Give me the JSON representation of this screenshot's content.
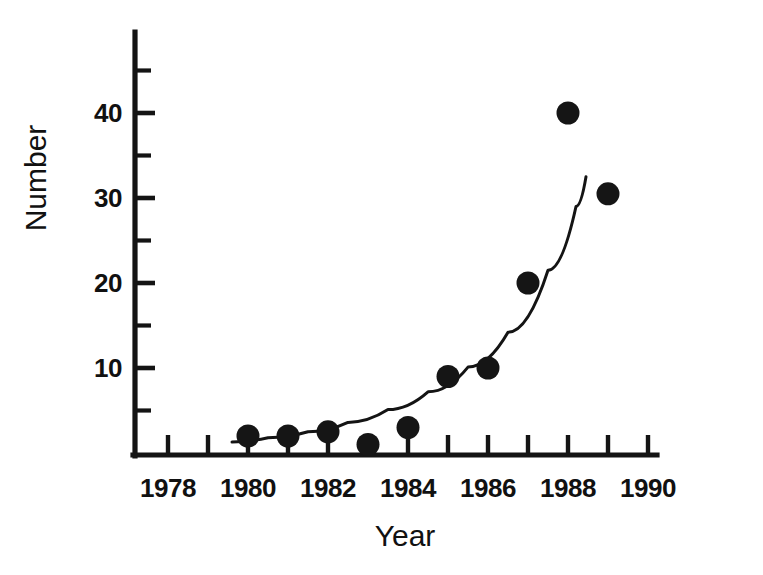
{
  "chart_data": {
    "type": "scatter",
    "title": "",
    "xlabel": "Year",
    "ylabel": "Number",
    "xlim": [
      1978,
      1990
    ],
    "ylim": [
      0,
      47.5
    ],
    "grid": false,
    "legend": null,
    "x": [
      1980,
      1981,
      1982,
      1983,
      1984,
      1985,
      1986,
      1987,
      1988,
      1989
    ],
    "values": [
      2,
      2,
      2.5,
      1,
      3,
      9,
      10,
      20,
      40,
      30.5
    ],
    "series": [
      {
        "name": "Observed number",
        "marker": "filled-circle",
        "color": "#151515",
        "points": [
          {
            "x": 1980,
            "y": 2
          },
          {
            "x": 1981,
            "y": 2
          },
          {
            "x": 1982,
            "y": 2.5
          },
          {
            "x": 1983,
            "y": 1
          },
          {
            "x": 1984,
            "y": 3
          },
          {
            "x": 1985,
            "y": 9
          },
          {
            "x": 1986,
            "y": 10
          },
          {
            "x": 1987,
            "y": 20
          },
          {
            "x": 1988,
            "y": 40
          },
          {
            "x": 1989,
            "y": 30.5
          }
        ]
      },
      {
        "name": "Fitted exponential curve",
        "marker": "none",
        "color": "#141414",
        "points": [
          {
            "x": 1979.6,
            "y": 1.3
          },
          {
            "x": 1980.5,
            "y": 1.8
          },
          {
            "x": 1981.5,
            "y": 2.5
          },
          {
            "x": 1982.5,
            "y": 3.6
          },
          {
            "x": 1983.5,
            "y": 5.1
          },
          {
            "x": 1984.5,
            "y": 7.2
          },
          {
            "x": 1985.5,
            "y": 10.1
          },
          {
            "x": 1986.5,
            "y": 14.2
          },
          {
            "x": 1987.5,
            "y": 21.5
          },
          {
            "x": 1988.2,
            "y": 29.0
          },
          {
            "x": 1988.45,
            "y": 32.5
          }
        ]
      }
    ],
    "x_ticks": [
      {
        "value": 1978,
        "label": "1978",
        "major": true
      },
      {
        "value": 1979,
        "label": "",
        "major": false
      },
      {
        "value": 1980,
        "label": "1980",
        "major": true
      },
      {
        "value": 1981,
        "label": "",
        "major": false
      },
      {
        "value": 1982,
        "label": "1982",
        "major": true
      },
      {
        "value": 1983,
        "label": "",
        "major": false
      },
      {
        "value": 1984,
        "label": "1984",
        "major": true
      },
      {
        "value": 1985,
        "label": "",
        "major": false
      },
      {
        "value": 1986,
        "label": "1986",
        "major": true
      },
      {
        "value": 1987,
        "label": "",
        "major": false
      },
      {
        "value": 1988,
        "label": "1988",
        "major": true
      },
      {
        "value": 1989,
        "label": "",
        "major": false
      },
      {
        "value": 1990,
        "label": "1990",
        "major": true
      }
    ],
    "y_ticks": [
      {
        "value": 5,
        "label": "",
        "major": false
      },
      {
        "value": 10,
        "label": "10",
        "major": true
      },
      {
        "value": 15,
        "label": "",
        "major": false
      },
      {
        "value": 20,
        "label": "20",
        "major": true
      },
      {
        "value": 25,
        "label": "",
        "major": false
      },
      {
        "value": 30,
        "label": "30",
        "major": true
      },
      {
        "value": 35,
        "label": "",
        "major": false
      },
      {
        "value": 40,
        "label": "40",
        "major": true
      },
      {
        "value": 45,
        "label": "",
        "major": false
      }
    ],
    "x_tick_labels": [
      "1978",
      "1980",
      "1982",
      "1984",
      "1986",
      "1988",
      "1990"
    ],
    "y_tick_labels": [
      "10",
      "20",
      "30",
      "40"
    ]
  },
  "colors": {
    "ink": "#141414",
    "marker": "#151515",
    "background": "#ffffff"
  }
}
